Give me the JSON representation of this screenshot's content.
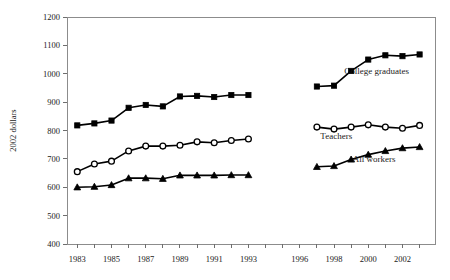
{
  "chart_data": {
    "type": "line",
    "title": "",
    "subtitle": "",
    "xlabel": "",
    "ylabel": "2002 dollars",
    "ylim": [
      400,
      1200
    ],
    "ytick_step": 100,
    "yticks": [
      400,
      500,
      600,
      700,
      800,
      900,
      1000,
      1100,
      1200
    ],
    "ytick_labels": [
      "400",
      "500",
      "600",
      "700",
      "800",
      "900",
      "1000",
      "1100",
      "1200"
    ],
    "xlim": [
      1982.4,
      2003.9
    ],
    "xticks": [
      1983,
      1984,
      1985,
      1986,
      1987,
      1988,
      1989,
      1990,
      1991,
      1992,
      1993,
      1994,
      1995,
      1996,
      1997,
      1998,
      1999,
      2000,
      2001,
      2002,
      2003
    ],
    "xtick_labels_shown": [
      "1983",
      "1985",
      "1987",
      "1989",
      "1991",
      "1993",
      "1996",
      "1998",
      "2000",
      "2002"
    ],
    "xtick_labeled_values": [
      1983,
      1985,
      1987,
      1989,
      1991,
      1993,
      1996,
      1998,
      2000,
      2002
    ],
    "grid": false,
    "legend_position": "inline-annotations",
    "series": [
      {
        "name": "College graduates",
        "marker": "filled-square",
        "label_x": 1998.6,
        "label_y": 1000,
        "segments": [
          {
            "x": [
              1983,
              1984,
              1985,
              1986,
              1987,
              1988,
              1989,
              1990,
              1991,
              1992,
              1993
            ],
            "values": [
              818,
              825,
              835,
              880,
              890,
              885,
              920,
              922,
              918,
              925,
              925
            ]
          },
          {
            "x": [
              1997,
              1998,
              1999,
              2000,
              2001,
              2002,
              2003
            ],
            "values": [
              955,
              958,
              1010,
              1050,
              1065,
              1062,
              1068
            ]
          }
        ]
      },
      {
        "name": "Teachers",
        "marker": "open-circle",
        "label_x": 1997.2,
        "label_y": 770,
        "segments": [
          {
            "x": [
              1983,
              1984,
              1985,
              1986,
              1987,
              1988,
              1989,
              1990,
              1991,
              1992,
              1993
            ],
            "values": [
              655,
              682,
              692,
              728,
              745,
              745,
              748,
              760,
              757,
              765,
              770
            ]
          },
          {
            "x": [
              1997,
              1998,
              1999,
              2000,
              2001,
              2002,
              2003
            ],
            "values": [
              812,
              805,
              812,
              820,
              812,
              808,
              818
            ]
          }
        ]
      },
      {
        "name": "All workers",
        "marker": "filled-triangle",
        "label_x": 1999.1,
        "label_y": 690,
        "segments": [
          {
            "x": [
              1983,
              1984,
              1985,
              1986,
              1987,
              1988,
              1989,
              1990,
              1991,
              1992,
              1993
            ],
            "values": [
              600,
              602,
              608,
              632,
              632,
              630,
              642,
              642,
              642,
              643,
              643
            ]
          },
          {
            "x": [
              1997,
              1998,
              1999,
              2000,
              2001,
              2002,
              2003
            ],
            "values": [
              672,
              675,
              698,
              715,
              728,
              738,
              742
            ]
          }
        ]
      }
    ],
    "colors": {
      "series_stroke": "#000000",
      "marker_fill": "#000000",
      "marker_open_fill": "#ffffff",
      "axis": "#7a7a7a",
      "text": "#1a1a1a",
      "background": "#ffffff"
    }
  }
}
